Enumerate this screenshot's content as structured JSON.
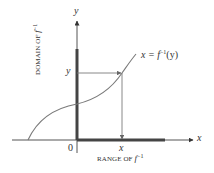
{
  "diagram": {
    "colors": {
      "axis": "#555555",
      "thick_segment": "#444444",
      "curve": "#7a7a7a",
      "arrow": "#7a7a7a",
      "text": "#333333"
    },
    "axes": {
      "x_label": "x",
      "y_label": "y",
      "origin_label": "0"
    },
    "curve_label": {
      "lhs": "x = f",
      "sup": "−1",
      "rhs": "(y)"
    },
    "domain_label": {
      "text": "DOMAIN OF f",
      "prefix": "DOMAIN OF ",
      "func": "f",
      "sup": "−1"
    },
    "range_label": {
      "prefix": "RANGE OF ",
      "func": "f",
      "sup": "−1"
    },
    "point_labels": {
      "y_tick": "y",
      "x_tick": "x"
    }
  }
}
